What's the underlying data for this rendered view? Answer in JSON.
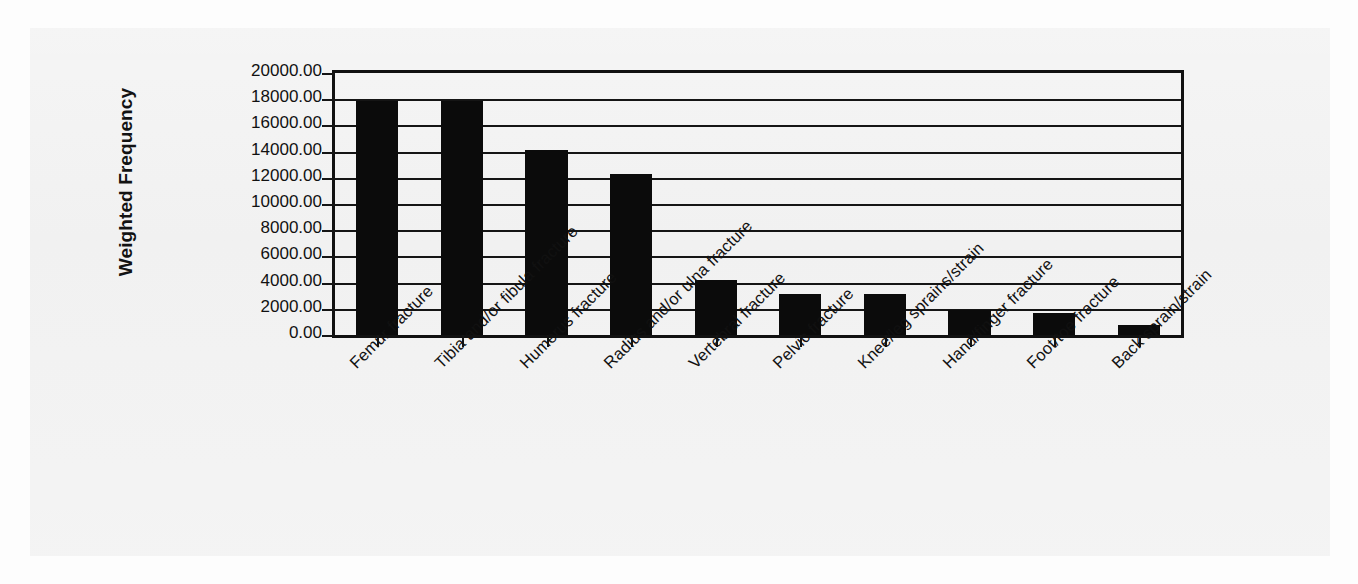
{
  "chart_data": {
    "type": "bar",
    "title": "",
    "xlabel": "",
    "ylabel": "Weighted Frequency",
    "ylim": [
      0,
      20000
    ],
    "grid": true,
    "legend": "none",
    "orientation": "vertical",
    "bar_color": "#0b0b0b",
    "categories": [
      "Femur fracture",
      "Tibia and/or fibula fracture",
      "Humerus fracture",
      "Radius and/or ulna fracture",
      "Vertebral fracture",
      "Pelvic fracture",
      "Knee/leg sprains/strain",
      "Hand/finger fracture",
      "Foot/toe fracture",
      "Back sprain/strain"
    ],
    "values": [
      17900,
      17900,
      14100,
      12300,
      4200,
      3100,
      3100,
      1900,
      1700,
      800
    ],
    "ytick_labels": [
      "20000.00",
      "18000.00",
      "16000.00",
      "14000.00",
      "12000.00",
      "10000.00",
      "8000.00",
      "6000.00",
      "4000.00",
      "2000.00",
      "0.00"
    ],
    "ytick_values": [
      20000,
      18000,
      16000,
      14000,
      12000,
      10000,
      8000,
      6000,
      4000,
      2000,
      0
    ]
  }
}
